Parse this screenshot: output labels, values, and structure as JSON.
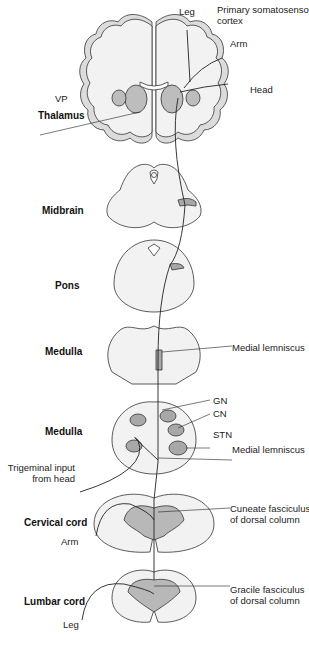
{
  "diagram": {
    "levels": [
      {
        "id": "thalamus",
        "label": "Thalamus"
      },
      {
        "id": "midbrain",
        "label": "Midbrain"
      },
      {
        "id": "pons",
        "label": "Pons"
      },
      {
        "id": "medulla_upper",
        "label": "Medulla"
      },
      {
        "id": "medulla_lower",
        "label": "Medulla"
      },
      {
        "id": "cervical",
        "label": "Cervical cord"
      },
      {
        "id": "lumbar",
        "label": "Lumbar cord"
      }
    ],
    "annotations": {
      "leg_cortex": "Leg",
      "primary_cortex_1": "Primary somatosensory",
      "primary_cortex_2": "cortex",
      "arm_cortex": "Arm",
      "head_cortex": "Head",
      "vp": "VP",
      "medial_lemniscus_upper": "Medial lemniscus",
      "gn": "GN",
      "cn": "CN",
      "stn": "STN",
      "medial_lemniscus_lower": "Medial lemniscus",
      "trigeminal_1": "Trigeminal input",
      "trigeminal_2": "from head",
      "cuneate_1": "Cuneate fasciculus",
      "cuneate_2": "of dorsal column",
      "arm_input": "Arm",
      "gracile_1": "Gracile fasciculus",
      "gracile_2": "of dorsal column",
      "leg_input": "Leg"
    },
    "colors": {
      "outline": "#333333",
      "tissue": "#f2f2f2",
      "gray_matter": "#b8b8b8",
      "nucleus": "#a8a8a8",
      "pathway": "#222222"
    }
  }
}
